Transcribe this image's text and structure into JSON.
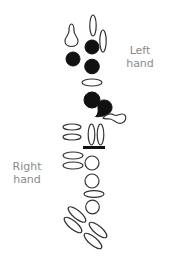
{
  "diagram": {
    "labels": {
      "left_hand_line1": "Left",
      "left_hand_line2": "hand",
      "right_hand_line1": "Right",
      "right_hand_line2": "hand"
    },
    "colors": {
      "stroke": "#333333",
      "fill_closed": "#111111",
      "label": "#8a8a8a",
      "background": "#ffffff"
    },
    "left_hand_keys": [
      {
        "name": "octave-key",
        "shape": "teardrop-outline",
        "state": "open"
      },
      {
        "name": "palm-key-1",
        "shape": "vertical-oval",
        "state": "open"
      },
      {
        "name": "palm-key-2",
        "shape": "vertical-oval",
        "state": "open"
      },
      {
        "name": "front-f-key",
        "shape": "circle",
        "state": "closed"
      },
      {
        "name": "lh-1",
        "shape": "circle",
        "state": "closed"
      },
      {
        "name": "lh-2",
        "shape": "circle",
        "state": "closed"
      },
      {
        "name": "bis-key",
        "shape": "horizontal-oval",
        "state": "open"
      },
      {
        "name": "lh-3",
        "shape": "circle",
        "state": "closed"
      },
      {
        "name": "g-sharp-key",
        "shape": "teardrop-filled",
        "state": "closed"
      },
      {
        "name": "low-keys-cluster",
        "shape": "teardrop-outline",
        "state": "open"
      }
    ],
    "right_hand_keys": [
      {
        "name": "side-key-1",
        "shape": "horizontal-oval",
        "state": "open"
      },
      {
        "name": "side-key-2",
        "shape": "horizontal-oval",
        "state": "open"
      },
      {
        "name": "side-key-3",
        "shape": "vertical-oval",
        "state": "open"
      },
      {
        "name": "side-key-4",
        "shape": "vertical-oval",
        "state": "open"
      },
      {
        "name": "hand-divider",
        "shape": "bar",
        "state": "n/a"
      },
      {
        "name": "side-key-5",
        "shape": "horizontal-oval",
        "state": "open"
      },
      {
        "name": "side-key-6",
        "shape": "horizontal-oval",
        "state": "open"
      },
      {
        "name": "rh-1",
        "shape": "circle",
        "state": "open"
      },
      {
        "name": "rh-2",
        "shape": "circle",
        "state": "open"
      },
      {
        "name": "f-sharp-key",
        "shape": "horizontal-oval",
        "state": "open"
      },
      {
        "name": "rh-3",
        "shape": "circle",
        "state": "open"
      },
      {
        "name": "pinky-key-1",
        "shape": "diagonal-oval",
        "state": "open"
      },
      {
        "name": "pinky-key-2",
        "shape": "diagonal-oval",
        "state": "open"
      },
      {
        "name": "pinky-key-3",
        "shape": "diagonal-oval",
        "state": "open"
      },
      {
        "name": "pinky-key-4",
        "shape": "diagonal-oval",
        "state": "open"
      }
    ]
  }
}
